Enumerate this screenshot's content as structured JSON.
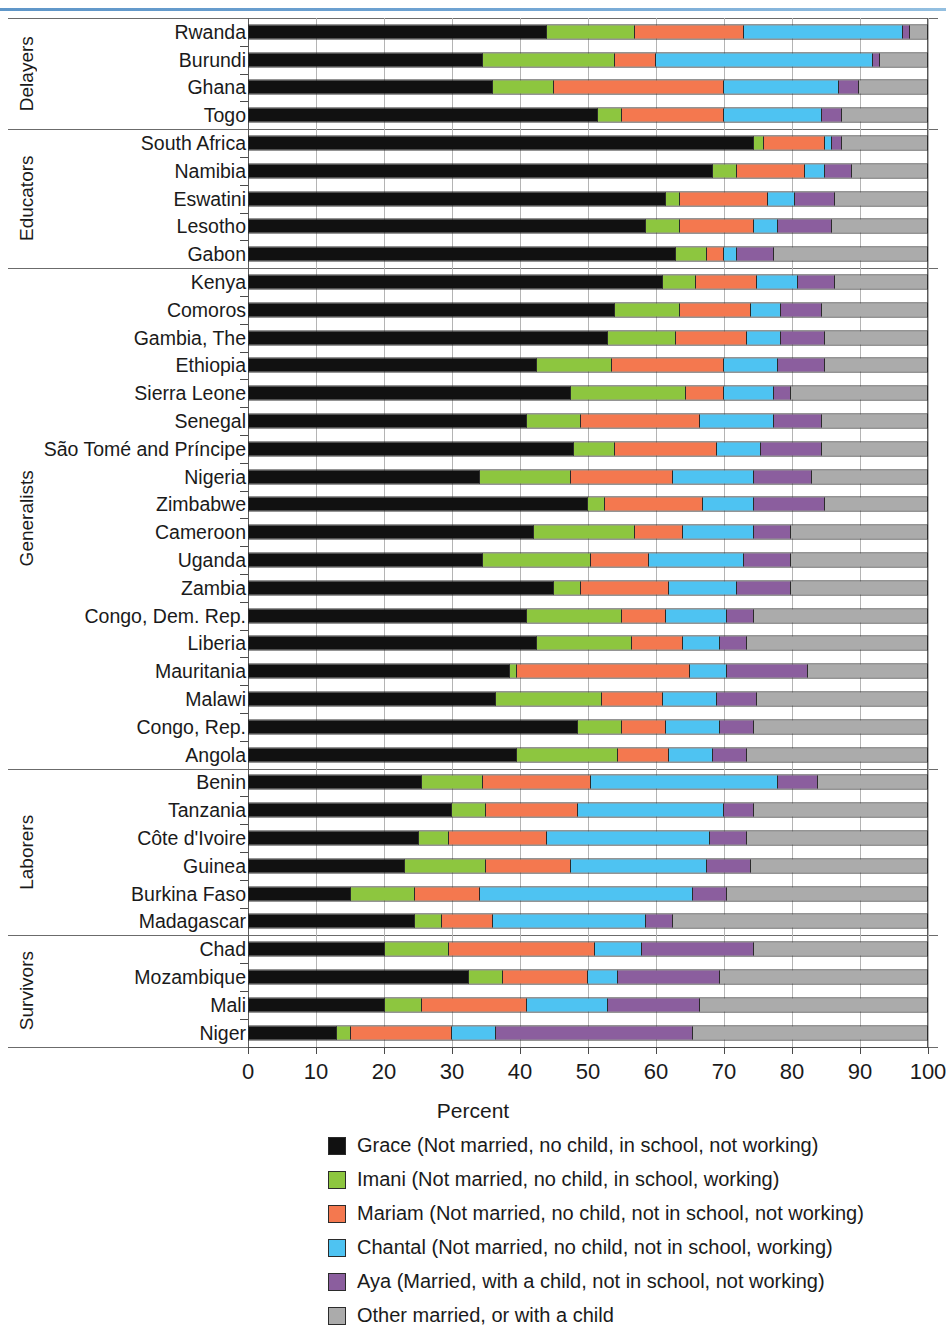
{
  "chart_data": {
    "type": "bar",
    "subtype": "horizontal-stacked-100",
    "title": "",
    "xlabel": "Percent",
    "ylabel": "",
    "xlim": [
      0,
      100
    ],
    "xticks": [
      0,
      10,
      20,
      30,
      40,
      50,
      60,
      70,
      80,
      90,
      100
    ],
    "xtick_labels": [
      "0",
      "10",
      "20",
      "30",
      "40",
      "50",
      "60",
      "70",
      "80",
      "90",
      "100"
    ],
    "grid": true,
    "legend_position": "bottom",
    "series": [
      {
        "name": "Grace (Not married, no child, in school, not working)",
        "short": "Grace",
        "color": "#111111"
      },
      {
        "name": "Imani (Not married, no child, in school, working)",
        "short": "Imani",
        "color": "#8DC63F"
      },
      {
        "name": "Mariam (Not married, no child, not in school, not working)",
        "short": "Mariam",
        "color": "#F4784F"
      },
      {
        "name": "Chantal (Not married, no child, not in school, working)",
        "short": "Chantal",
        "color": "#4EC3F2"
      },
      {
        "name": "Aya (Married, with a child, not in school, not working)",
        "short": "Aya",
        "color": "#8B5E9E"
      },
      {
        "name": "Other married, or with a child",
        "short": "Other",
        "color": "#ABABAB"
      }
    ],
    "groups": [
      {
        "label": "Delayers",
        "rows": [
          {
            "category": "Rwanda",
            "values": [
              44.0,
              13.0,
              16.0,
              23.5,
              1.0,
              2.5
            ]
          },
          {
            "category": "Burundi",
            "values": [
              34.5,
              19.5,
              6.0,
              32.0,
              1.0,
              7.0
            ]
          },
          {
            "category": "Ghana",
            "values": [
              36.0,
              9.0,
              25.0,
              17.0,
              3.0,
              10.0
            ]
          },
          {
            "category": "Togo",
            "values": [
              51.5,
              3.5,
              15.0,
              14.5,
              3.0,
              12.5
            ]
          }
        ]
      },
      {
        "label": "Educators",
        "rows": [
          {
            "category": "South Africa",
            "values": [
              74.5,
              1.5,
              9.0,
              1.0,
              1.5,
              12.5
            ]
          },
          {
            "category": "Namibia",
            "values": [
              68.5,
              3.5,
              10.0,
              3.0,
              4.0,
              11.0
            ]
          },
          {
            "category": "Eswatini",
            "values": [
              61.5,
              2.0,
              13.0,
              4.0,
              6.0,
              13.5
            ]
          },
          {
            "category": "Lesotho",
            "values": [
              58.5,
              5.0,
              11.0,
              3.5,
              8.0,
              14.0
            ]
          },
          {
            "category": "Gabon",
            "values": [
              63.0,
              4.5,
              2.5,
              2.0,
              5.5,
              22.5
            ]
          }
        ]
      },
      {
        "label": "Generalists",
        "rows": [
          {
            "category": "Kenya",
            "values": [
              61.0,
              5.0,
              9.0,
              6.0,
              5.5,
              13.5
            ]
          },
          {
            "category": "Comoros",
            "values": [
              54.0,
              9.5,
              10.5,
              4.5,
              6.0,
              15.5
            ]
          },
          {
            "category": "Gambia, The",
            "values": [
              53.0,
              10.0,
              10.5,
              5.0,
              6.5,
              15.0
            ]
          },
          {
            "category": "Ethiopia",
            "values": [
              42.5,
              11.0,
              16.5,
              8.0,
              7.0,
              15.0
            ]
          },
          {
            "category": "Sierra Leone",
            "values": [
              47.5,
              17.0,
              5.5,
              7.5,
              2.5,
              20.0
            ]
          },
          {
            "category": "Senegal",
            "values": [
              41.0,
              8.0,
              17.5,
              11.0,
              7.0,
              15.5
            ]
          },
          {
            "category": "São Tomé and Príncipe",
            "values": [
              48.0,
              6.0,
              15.0,
              6.5,
              9.0,
              15.5
            ]
          },
          {
            "category": "Nigeria",
            "values": [
              34.0,
              13.5,
              15.0,
              12.0,
              8.5,
              17.0
            ]
          },
          {
            "category": "Zimbabwe",
            "values": [
              50.0,
              2.5,
              14.5,
              7.5,
              10.5,
              15.0
            ]
          },
          {
            "category": "Cameroon",
            "values": [
              42.0,
              15.0,
              7.0,
              10.5,
              5.5,
              20.0
            ]
          },
          {
            "category": "Uganda",
            "values": [
              34.5,
              16.0,
              8.5,
              14.0,
              7.0,
              20.0
            ]
          },
          {
            "category": "Zambia",
            "values": [
              45.0,
              4.0,
              13.0,
              10.0,
              8.0,
              20.0
            ]
          },
          {
            "category": "Congo, Dem. Rep.",
            "values": [
              41.0,
              14.0,
              6.5,
              9.0,
              4.0,
              25.5
            ]
          },
          {
            "category": "Liberia",
            "values": [
              42.5,
              14.0,
              7.5,
              5.5,
              4.0,
              26.5
            ]
          },
          {
            "category": "Mauritania",
            "values": [
              38.5,
              1.0,
              25.5,
              5.5,
              12.0,
              17.5
            ]
          },
          {
            "category": "Malawi",
            "values": [
              36.5,
              15.5,
              9.0,
              8.0,
              6.0,
              25.0
            ]
          },
          {
            "category": "Congo, Rep.",
            "values": [
              48.5,
              6.5,
              6.5,
              8.0,
              5.0,
              25.5
            ]
          },
          {
            "category": "Angola",
            "values": [
              39.5,
              15.0,
              7.5,
              6.5,
              5.0,
              26.5
            ]
          }
        ]
      },
      {
        "label": "Laborers",
        "rows": [
          {
            "category": "Benin",
            "values": [
              25.5,
              9.0,
              16.0,
              27.5,
              6.0,
              16.0
            ]
          },
          {
            "category": "Tanzania",
            "values": [
              30.0,
              5.0,
              13.5,
              21.5,
              4.5,
              25.5
            ]
          },
          {
            "category": "Côte d'Ivoire",
            "values": [
              25.0,
              4.5,
              14.5,
              24.0,
              5.5,
              26.5
            ]
          },
          {
            "category": "Guinea",
            "values": [
              23.0,
              12.0,
              12.5,
              20.0,
              6.5,
              26.0
            ]
          },
          {
            "category": "Burkina Faso",
            "values": [
              15.0,
              9.5,
              9.5,
              31.5,
              5.0,
              29.5
            ]
          },
          {
            "category": "Madagascar",
            "values": [
              24.5,
              4.0,
              7.5,
              22.5,
              4.0,
              37.5
            ]
          }
        ]
      },
      {
        "label": "Survivors",
        "rows": [
          {
            "category": "Chad",
            "values": [
              20.0,
              9.5,
              21.5,
              7.0,
              16.5,
              25.5
            ]
          },
          {
            "category": "Mozambique",
            "values": [
              32.5,
              5.0,
              12.5,
              4.5,
              15.0,
              30.5
            ]
          },
          {
            "category": "Mali",
            "values": [
              20.0,
              5.5,
              15.5,
              12.0,
              13.5,
              33.5
            ]
          },
          {
            "category": "Niger",
            "values": [
              13.0,
              2.0,
              15.0,
              6.5,
              29.0,
              34.5
            ]
          }
        ]
      }
    ]
  }
}
